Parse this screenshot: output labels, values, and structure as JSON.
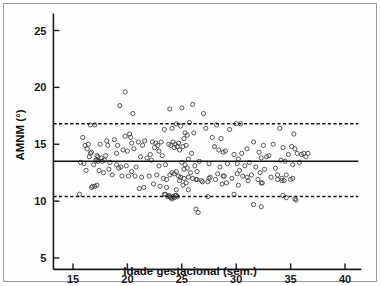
{
  "figure": {
    "background_color": "#ffffff",
    "border_color": "#9a9a9a",
    "marker_color": "#3c3c3c",
    "line_color": "#111111"
  },
  "chart_data": {
    "type": "scatter",
    "title": "",
    "subtitle": "",
    "xlabel": "Idade gestacional (sem.)",
    "ylabel": "AMNM (°)",
    "xlim": [
      13.2,
      41.5
    ],
    "ylim": [
      4.0,
      26.5
    ],
    "xticks": [
      15,
      20,
      25,
      30,
      35,
      40
    ],
    "xticklabels": [
      "15",
      "20",
      "25",
      "30",
      "35",
      "40"
    ],
    "yticks": [
      5,
      10,
      15,
      20,
      25
    ],
    "yticklabels": [
      "5",
      "10",
      "15",
      "20",
      "25"
    ],
    "grid": false,
    "legend": null,
    "annotations": [],
    "reference_lines": [
      {
        "name": "mean",
        "style": "solid",
        "y": 13.5,
        "label": ""
      },
      {
        "name": "upper-limit-of-agreement",
        "style": "dashed",
        "y": 16.8,
        "label": ""
      },
      {
        "name": "lower-limit-of-agreement",
        "style": "dashed",
        "y": 10.4,
        "label": ""
      }
    ],
    "marker": {
      "shape": "circle",
      "filled": false,
      "size": 4.2
    },
    "series": [
      {
        "name": "AMNM por idade gestacional",
        "x": [
          15.6,
          15.7,
          15.9,
          16.0,
          16.1,
          16.2,
          16.3,
          16.4,
          16.5,
          16.6,
          16.7,
          16.7,
          16.8,
          16.9,
          17.0,
          17.0,
          17.1,
          17.2,
          17.2,
          17.3,
          17.4,
          17.5,
          17.6,
          17.7,
          17.8,
          17.9,
          18.0,
          18.1,
          18.2,
          18.3,
          18.4,
          18.6,
          18.8,
          19.0,
          19.1,
          19.2,
          19.3,
          19.4,
          19.5,
          19.6,
          19.8,
          19.9,
          20.0,
          20.1,
          20.2,
          20.3,
          20.4,
          20.5,
          20.6,
          20.7,
          20.8,
          21.0,
          21.1,
          21.2,
          21.3,
          21.4,
          21.5,
          21.6,
          21.8,
          22.0,
          22.1,
          22.2,
          22.3,
          22.4,
          22.5,
          22.6,
          22.7,
          22.8,
          22.9,
          23.0,
          23.1,
          23.2,
          23.3,
          23.4,
          23.5,
          23.5,
          23.6,
          23.7,
          23.8,
          23.8,
          23.9,
          23.9,
          24.0,
          24.0,
          24.1,
          24.1,
          24.2,
          24.2,
          24.3,
          24.3,
          24.4,
          24.4,
          24.5,
          24.5,
          24.6,
          24.6,
          24.7,
          24.7,
          24.8,
          24.8,
          24.9,
          24.9,
          25.0,
          25.0,
          25.1,
          25.1,
          25.2,
          25.2,
          25.3,
          25.3,
          25.4,
          25.4,
          25.5,
          25.5,
          25.6,
          25.6,
          25.7,
          25.8,
          25.9,
          26.0,
          26.1,
          26.2,
          26.3,
          26.4,
          26.5,
          26.6,
          26.8,
          27.0,
          27.2,
          27.4,
          27.5,
          27.6,
          27.8,
          28.0,
          28.1,
          28.2,
          28.3,
          28.4,
          28.5,
          28.6,
          28.7,
          28.8,
          28.9,
          29.0,
          29.1,
          29.2,
          29.4,
          29.6,
          29.8,
          30.0,
          30.1,
          30.2,
          30.3,
          30.4,
          30.5,
          30.6,
          30.8,
          31.0,
          31.1,
          31.2,
          31.4,
          31.6,
          31.8,
          32.0,
          32.1,
          32.2,
          32.3,
          32.4,
          32.5,
          32.6,
          32.8,
          33.0,
          33.2,
          33.4,
          33.6,
          33.8,
          34.0,
          34.1,
          34.2,
          34.3,
          34.4,
          34.5,
          34.6,
          34.8,
          35.0,
          35.1,
          35.2,
          35.3,
          35.4,
          35.5,
          35.6,
          35.8,
          36.0,
          36.2,
          36.4,
          36.6,
          19.0,
          19.8,
          20.4,
          22.9,
          23.6,
          24.5,
          25.2,
          25.6,
          26.0,
          26.4,
          26.9,
          27.5,
          28.8,
          30.1,
          30.2,
          31.0,
          32.3,
          33.8,
          34.2,
          35.2,
          16.6,
          17.2,
          17.3,
          23.4,
          23.9,
          24.1,
          24.3,
          24.5,
          26.3,
          27.4,
          29.8,
          31.6,
          32.3,
          34.3,
          34.6,
          35.4
        ],
        "y": [
          10.6,
          13.4,
          15.6,
          13.3,
          14.9,
          12.7,
          14.6,
          15.0,
          13.9,
          16.7,
          11.2,
          14.3,
          11.3,
          13.2,
          11.3,
          16.7,
          13.6,
          11.4,
          14.0,
          13.5,
          12.7,
          15.0,
          13.8,
          13.5,
          12.5,
          13.6,
          14.0,
          15.3,
          14.9,
          12.8,
          13.4,
          12.3,
          15.4,
          14.2,
          14.9,
          12.9,
          18.4,
          13.0,
          12.2,
          14.5,
          19.6,
          13.1,
          14.4,
          12.2,
          15.9,
          15.6,
          15.1,
          17.7,
          14.6,
          12.2,
          13.0,
          15.2,
          11.1,
          13.9,
          12.1,
          14.9,
          11.2,
          15.3,
          13.8,
          12.2,
          14.1,
          13.6,
          15.2,
          11.5,
          14.7,
          15.1,
          12.3,
          14.9,
          14.4,
          11.3,
          15.2,
          14.0,
          12.0,
          16.3,
          10.6,
          13.2,
          11.9,
          10.4,
          15.0,
          10.5,
          18.1,
          12.3,
          14.9,
          10.3,
          16.4,
          12.5,
          15.2,
          10.4,
          14.7,
          12.4,
          15.0,
          10.5,
          16.8,
          12.6,
          14.8,
          10.4,
          15.1,
          12.2,
          14.5,
          11.8,
          16.6,
          12.1,
          18.2,
          13.4,
          14.8,
          11.4,
          15.5,
          12.0,
          16.0,
          13.2,
          14.9,
          11.6,
          15.8,
          12.9,
          13.7,
          11.0,
          16.9,
          12.5,
          14.2,
          18.5,
          16.0,
          13.1,
          11.9,
          12.6,
          9.0,
          13.5,
          11.8,
          17.7,
          16.4,
          11.7,
          13.3,
          12.1,
          15.6,
          14.8,
          11.9,
          16.7,
          12.4,
          14.5,
          13.0,
          15.5,
          11.5,
          14.3,
          12.2,
          14.4,
          11.6,
          13.3,
          16.3,
          12.0,
          14.1,
          16.8,
          13.3,
          11.4,
          12.7,
          16.8,
          14.2,
          12.2,
          13.1,
          14.6,
          11.8,
          13.4,
          12.3,
          15.2,
          13.0,
          11.9,
          14.3,
          12.5,
          13.8,
          11.6,
          14.9,
          12.8,
          13.9,
          14.0,
          12.1,
          15.0,
          12.9,
          11.9,
          16.4,
          13.6,
          12.0,
          14.7,
          11.8,
          13.5,
          12.3,
          14.1,
          11.9,
          14.8,
          13.2,
          15.9,
          14.6,
          10.1,
          14.2,
          13.4,
          14.1,
          14.2,
          13.9,
          14.2,
          13.2,
          15.7,
          12.6,
          13.1,
          11.2,
          11.0,
          12.8,
          12.1,
          12.0,
          11.9,
          11.7,
          12.0,
          12.2,
          12.4,
          13.7,
          12.1,
          11.6,
          12.3,
          11.8,
          12.0,
          14.2,
          13.6,
          13.9,
          10.6,
          10.4,
          10.2,
          10.3,
          10.5,
          9.3,
          10.4,
          10.6,
          9.7,
          9.5,
          10.5,
          10.3,
          10.2
        ]
      }
    ]
  }
}
